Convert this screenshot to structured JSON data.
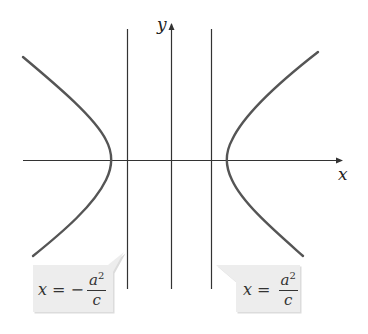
{
  "diagram": {
    "type": "hyperbola-with-directrices",
    "axes": {
      "x_label": "x",
      "y_label": "y"
    },
    "colors": {
      "curve": "#555555",
      "axis": "#333333",
      "callout_bg": "#ececec",
      "callout_shadow": "#dcdcdc"
    },
    "callouts": [
      {
        "id": "left-directrix",
        "lhs": "x = −",
        "numerator": "a",
        "exponent": "2",
        "denominator": "c"
      },
      {
        "id": "right-directrix",
        "lhs": "x = ",
        "numerator": "a",
        "exponent": "2",
        "denominator": "c"
      }
    ]
  }
}
